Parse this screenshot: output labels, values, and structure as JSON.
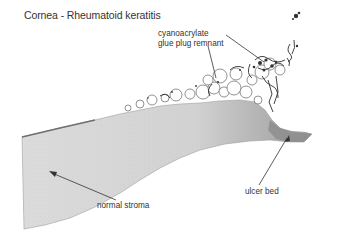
{
  "figure": {
    "title": "Cornea - Rheumatoid keratitis",
    "labels": {
      "glue_line1": "cyanoacrylate",
      "glue_line2": "glue plug remnant",
      "stroma": "normal stroma",
      "ulcer": "ulcer bed"
    },
    "colors": {
      "stroma_fill": "#d9d9d9",
      "stroma_dark": "#a8a8a8",
      "glue_ink": "#3a3a3a",
      "text": "#333333"
    }
  }
}
